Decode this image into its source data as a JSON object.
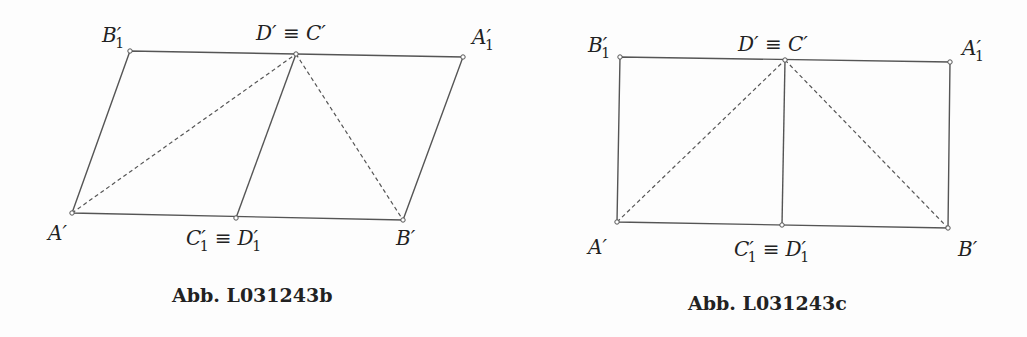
{
  "figures": [
    {
      "caption": "Abb. L031243b",
      "shape": "parallelogram",
      "points": {
        "B1p": {
          "label": "B",
          "sub": "1",
          "x": 130,
          "y": 51
        },
        "Dp": {
          "label": "D′ ≡ C′",
          "x": 296,
          "y": 54
        },
        "A1p": {
          "label": "A",
          "sub": "1",
          "x": 463,
          "y": 57
        },
        "Ap": {
          "label": "A′",
          "x": 72,
          "y": 213
        },
        "C1p": {
          "label": "C′₁ ≡ D′₁",
          "x": 236,
          "y": 218
        },
        "Bp": {
          "label": "B′",
          "x": 403,
          "y": 220
        }
      },
      "solid_segments": [
        [
          "Ap",
          "B1p"
        ],
        [
          "B1p",
          "A1p"
        ],
        [
          "A1p",
          "Bp"
        ],
        [
          "Bp",
          "Ap"
        ],
        [
          "C1p",
          "Dp"
        ]
      ],
      "dashed_segments": [
        [
          "Ap",
          "Dp"
        ],
        [
          "Dp",
          "Bp"
        ]
      ]
    },
    {
      "caption": "Abb. L031243c",
      "shape": "rectangle",
      "points": {
        "B1p": {
          "label": "B",
          "sub": "1",
          "x": 620,
          "y": 57
        },
        "Dp": {
          "label": "D′ ≡ C′",
          "x": 785,
          "y": 60
        },
        "A1p": {
          "label": "A",
          "sub": "1",
          "x": 950,
          "y": 62
        },
        "Ap": {
          "label": "A′",
          "x": 617,
          "y": 222
        },
        "C1p": {
          "label": "C′₁ ≡ D′₁",
          "x": 782,
          "y": 225
        },
        "Bp": {
          "label": "B′",
          "x": 948,
          "y": 228
        }
      },
      "solid_segments": [
        [
          "Ap",
          "B1p"
        ],
        [
          "B1p",
          "A1p"
        ],
        [
          "A1p",
          "Bp"
        ],
        [
          "Bp",
          "Ap"
        ],
        [
          "C1p",
          "Dp"
        ]
      ],
      "dashed_segments": [
        [
          "Ap",
          "Dp"
        ],
        [
          "Dp",
          "Bp"
        ]
      ]
    }
  ],
  "labels": {
    "left": {
      "B1": "B",
      "B1_prime": "′",
      "B1_sub": "1",
      "DC": "D′ ≡ C′",
      "A1": "A",
      "A1_prime": "′",
      "A1_sub": "1",
      "A": "A′",
      "C1": "C",
      "C1_prime": "′",
      "C1_sub": "1",
      "equiv": "≡",
      "D1": "D",
      "D1_prime": "′",
      "D1_sub": "1",
      "B": "B′",
      "caption": "Abb. L031243b"
    },
    "right": {
      "B1": "B",
      "B1_prime": "′",
      "B1_sub": "1",
      "DC": "D′ ≡ C′",
      "A1": "A",
      "A1_prime": "′",
      "A1_sub": "1",
      "A": "A′",
      "C1": "C",
      "C1_prime": "′",
      "C1_sub": "1",
      "equiv": "≡",
      "D1": "D",
      "D1_prime": "′",
      "D1_sub": "1",
      "B": "B′",
      "caption": "Abb. L031243c"
    }
  }
}
